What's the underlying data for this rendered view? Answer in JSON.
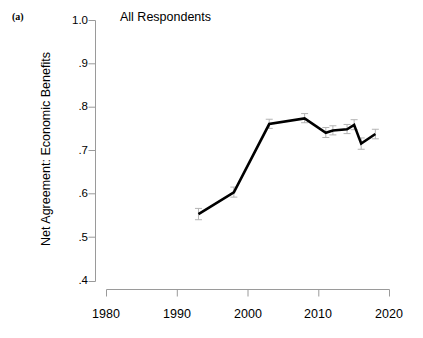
{
  "figure": {
    "panel_label": "(a)",
    "background_color": "#ffffff",
    "line_color": "#000000",
    "axis_color": "#9a9a9a",
    "error_bar_color": "#b4b4b4"
  },
  "chart_data": {
    "type": "line",
    "title": "All Respondents",
    "xlabel": "",
    "ylabel": "Net Agreement: Economic Benefits",
    "xlim": [
      1980,
      2020
    ],
    "ylim": [
      0.4,
      1.0
    ],
    "grid": false,
    "legend": null,
    "x_ticks": [
      1980,
      1990,
      2000,
      2010,
      2020
    ],
    "x_tick_labels": [
      "1980",
      "1990",
      "2000",
      "2010",
      "2020"
    ],
    "y_ticks": [
      0.4,
      0.5,
      0.6,
      0.7,
      0.8,
      0.9,
      1.0
    ],
    "y_tick_labels": [
      ".4",
      ".5",
      ".6",
      ".7",
      ".8",
      ".9",
      "1.0"
    ],
    "x": [
      1993,
      1998,
      2003,
      2008,
      2011,
      2012,
      2014,
      2015,
      2016,
      2018
    ],
    "values": [
      0.555,
      0.605,
      0.762,
      0.775,
      0.742,
      0.747,
      0.75,
      0.76,
      0.717,
      0.739
    ],
    "error_low": [
      0.542,
      0.594,
      0.752,
      0.765,
      0.731,
      0.737,
      0.74,
      0.749,
      0.704,
      0.728
    ],
    "error_high": [
      0.568,
      0.617,
      0.773,
      0.786,
      0.754,
      0.758,
      0.761,
      0.772,
      0.73,
      0.75
    ],
    "series": [
      {
        "name": "All Respondents",
        "x": [
          1993,
          1998,
          2003,
          2008,
          2011,
          2012,
          2014,
          2015,
          2016,
          2018
        ],
        "values": [
          0.555,
          0.605,
          0.762,
          0.775,
          0.742,
          0.747,
          0.75,
          0.76,
          0.717,
          0.739
        ]
      }
    ]
  }
}
